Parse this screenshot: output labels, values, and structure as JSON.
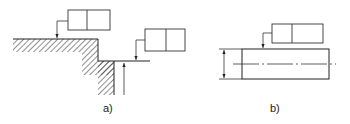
{
  "figure": {
    "panels": [
      {
        "id": "a",
        "label": "a)",
        "elements": [
          "stepped hatched surface",
          "feature control frame on upper surface",
          "feature control frame on lower step with extension line",
          "upward dimension arrow"
        ]
      },
      {
        "id": "b",
        "label": "b)",
        "elements": [
          "rectangular part with center line",
          "feature control frame on top edge",
          "vertical dimension line with arrows"
        ]
      }
    ],
    "colors": {
      "line": "#222222",
      "background": "#ffffff"
    }
  }
}
